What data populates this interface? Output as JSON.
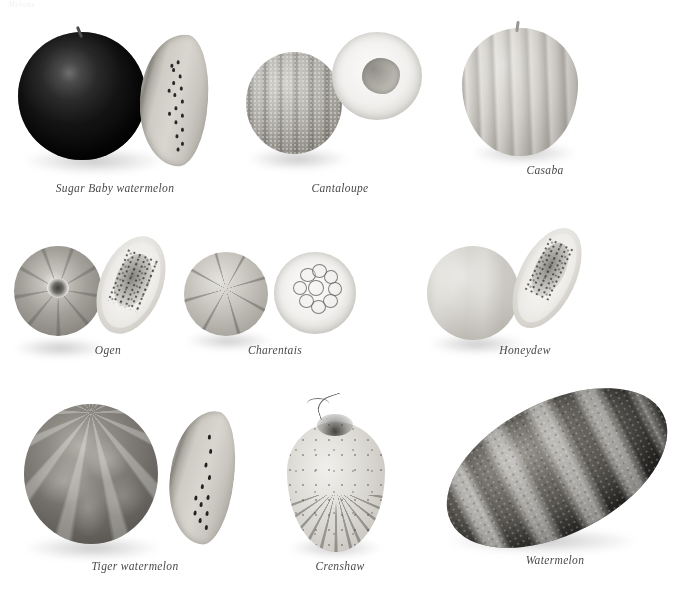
{
  "page": {
    "running_head": "Melons",
    "background_color": "#ffffff",
    "caption_color": "#4a4a4a",
    "width": 700,
    "height": 604
  },
  "plate": {
    "title": "Melons",
    "rows": [
      {
        "row_index": 1,
        "items": [
          {
            "caption": "Sugar Baby watermelon",
            "parts": [
              "whole dark-green sphere with stem",
              "cut wedge showing pale flesh and dark seeds"
            ]
          },
          {
            "caption": "Cantaloupe",
            "parts": [
              "whole netted ribbed sphere",
              "cut half showing seed cavity"
            ]
          },
          {
            "caption": "Casaba",
            "parts": [
              "whole ribbed pale ovoid with stem"
            ]
          }
        ]
      },
      {
        "row_index": 2,
        "items": [
          {
            "caption": "Ogen",
            "parts": [
              "whole ribbed sphere with pale stem scar",
              "oblong cut half with seed mass"
            ]
          },
          {
            "caption": "Charentais",
            "parts": [
              "whole sutured sphere",
              "cut half showing ring of seeds"
            ]
          },
          {
            "caption": "Honeydew",
            "parts": [
              "whole smooth pale melon",
              "cut wedge with seeds"
            ]
          }
        ]
      },
      {
        "row_index": 3,
        "items": [
          {
            "caption": "Tiger watermelon",
            "parts": [
              "whole striped round melon",
              "cut wedge with dark seeds"
            ]
          },
          {
            "caption": "Crenshaw",
            "parts": [
              "whole teardrop melon with curled stem"
            ]
          },
          {
            "caption": "Watermelon",
            "parts": [
              "whole large oblong striped melon"
            ]
          }
        ]
      }
    ]
  }
}
